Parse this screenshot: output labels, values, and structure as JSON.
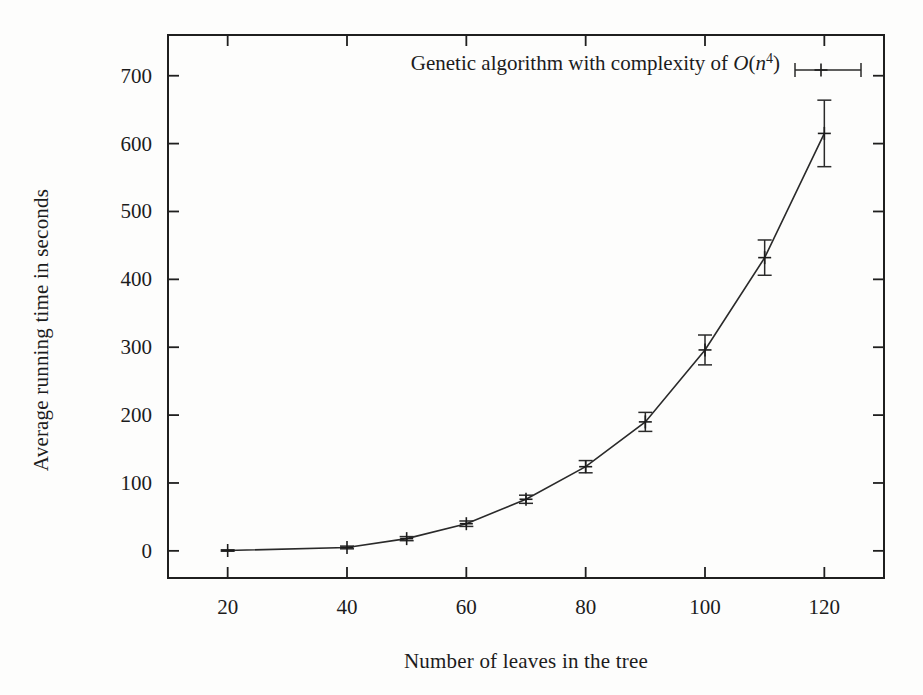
{
  "chart_data": {
    "type": "line",
    "title": "",
    "subtitle": "",
    "xlabel": "Number of leaves in the tree",
    "ylabel": "Average running time in seconds",
    "xlim": [
      10,
      130
    ],
    "ylim": [
      -40,
      760
    ],
    "xticks": [
      20,
      40,
      60,
      80,
      100,
      120
    ],
    "xtick_labels": [
      "20",
      "40",
      "60",
      "80",
      "100",
      "120"
    ],
    "yticks": [
      0,
      100,
      200,
      300,
      400,
      500,
      600,
      700
    ],
    "ytick_labels": [
      "0",
      "100",
      "200",
      "300",
      "400",
      "500",
      "600",
      "700"
    ],
    "grid": false,
    "legend_position": "top-center-inside",
    "legend": [
      {
        "label": "Genetic algorithm with complexity of O(n^4)",
        "label_parts": {
          "prefix": "Genetic algorithm with complexity of ",
          "symbol": "O",
          "open": "(",
          "base": "n",
          "exponent": "4",
          "close": ")"
        },
        "marker": "plus-with-errorbar",
        "color": "#2a2a2a"
      }
    ],
    "series": [
      {
        "name": "Genetic algorithm with complexity of O(n^4)",
        "x": [
          20,
          40,
          50,
          60,
          70,
          80,
          90,
          100,
          110,
          120
        ],
        "values": [
          0.5,
          5,
          18,
          40,
          76,
          124,
          190,
          296,
          432,
          615
        ],
        "yerr": [
          1,
          2,
          3,
          4,
          6,
          9,
          14,
          22,
          26,
          49
        ],
        "color": "#2a2a2a"
      }
    ]
  },
  "figure": {
    "background_color": "#fdfdfc",
    "axis_color": "#1f1f1f",
    "text_color": "#1c1c1c"
  }
}
